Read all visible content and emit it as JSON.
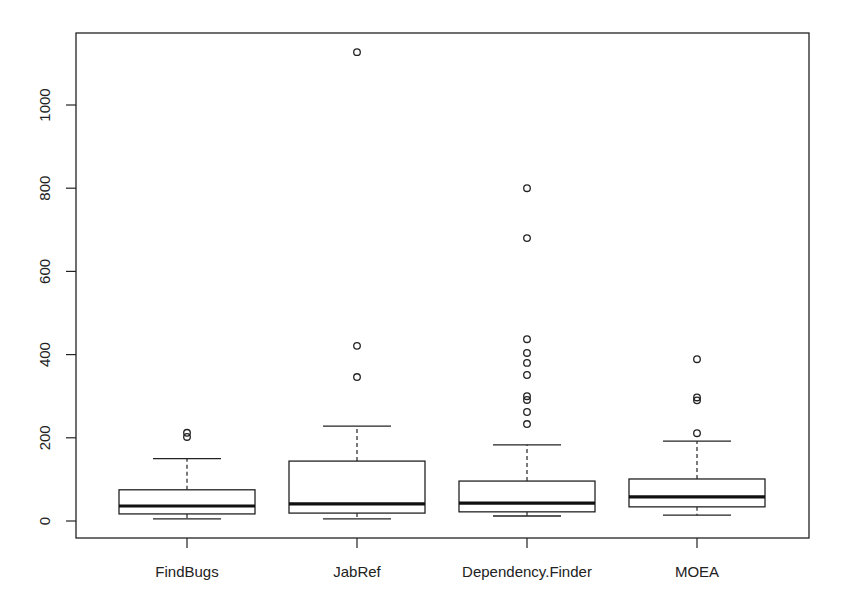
{
  "chart_data": {
    "type": "boxplot",
    "title": "",
    "xlabel": "",
    "ylabel": "",
    "ylim": [
      0,
      1150
    ],
    "grid": false,
    "legend": null,
    "yticks": [
      0,
      200,
      400,
      600,
      800,
      1000
    ],
    "ytick_labels": [
      "0",
      "200",
      "400",
      "600",
      "800",
      "1000"
    ],
    "categories": [
      "FindBugs",
      "JabRef",
      "Dependency.Finder",
      "MOEA"
    ],
    "series": [
      {
        "name": "FindBugs",
        "whisker_low": 5,
        "q1": 17,
        "median": 36,
        "q3": 75,
        "whisker_high": 150,
        "outliers": [
          202,
          212
        ]
      },
      {
        "name": "JabRef",
        "whisker_low": 5,
        "q1": 19,
        "median": 41,
        "q3": 144,
        "whisker_high": 228,
        "outliers": [
          346,
          421,
          1127
        ]
      },
      {
        "name": "Dependency.Finder",
        "whisker_low": 12,
        "q1": 22,
        "median": 43,
        "q3": 96,
        "whisker_high": 183,
        "outliers": [
          233,
          262,
          291,
          300,
          351,
          380,
          404,
          437,
          680,
          800
        ]
      },
      {
        "name": "MOEA",
        "whisker_low": 14,
        "q1": 34,
        "median": 58,
        "q3": 101,
        "whisker_high": 192,
        "outliers": [
          211,
          290,
          297,
          389
        ]
      }
    ]
  },
  "style": {
    "line_color": "#222222",
    "background": "#ffffff"
  }
}
